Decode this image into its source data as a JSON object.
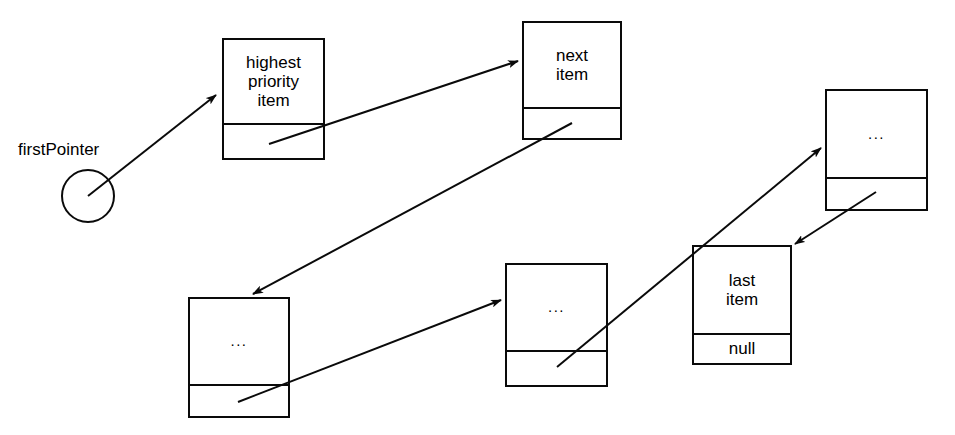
{
  "diagram": {
    "type": "linked-list",
    "background_color": "#ffffff",
    "stroke_color": "#0a0a0a",
    "text_color": "#000000",
    "canvas": {
      "width": 955,
      "height": 435
    }
  },
  "pointer": {
    "label": "firstPointer",
    "circle": {
      "cx": 88,
      "cy": 196,
      "r": 26
    }
  },
  "nodes": [
    {
      "id": "node-highest-priority-item",
      "data_label": "highest\npriority\nitem",
      "pointer_label": "",
      "box": {
        "x": 222,
        "y": 38,
        "w": 103,
        "h": 122,
        "divider_y": 123
      }
    },
    {
      "id": "node-next-item",
      "data_label": "next\nitem",
      "pointer_label": "",
      "box": {
        "x": 522,
        "y": 21,
        "w": 100,
        "h": 119,
        "divider_y": 107
      }
    },
    {
      "id": "node-ellipsis-right",
      "data_label": "...",
      "pointer_label": "",
      "box": {
        "x": 825,
        "y": 89,
        "w": 103,
        "h": 122,
        "divider_y": 177
      }
    },
    {
      "id": "node-ellipsis-bottom-left",
      "data_label": "...",
      "pointer_label": "",
      "box": {
        "x": 188,
        "y": 297,
        "w": 102,
        "h": 121,
        "divider_y": 384
      }
    },
    {
      "id": "node-ellipsis-bottom-middle",
      "data_label": "...",
      "pointer_label": "",
      "box": {
        "x": 505,
        "y": 263,
        "w": 103,
        "h": 124,
        "divider_y": 350
      }
    },
    {
      "id": "node-last-item",
      "data_label": "last\nitem",
      "pointer_label": "null",
      "box": {
        "x": 692,
        "y": 245,
        "w": 100,
        "h": 120,
        "divider_y": 333
      }
    }
  ],
  "arrows": [
    {
      "id": "arrow-firstpointer-to-highest",
      "from": "firstPointer circle",
      "to": "node-highest-priority-item",
      "x1": 88,
      "y1": 196,
      "x2": 216,
      "y2": 95
    },
    {
      "id": "arrow-highest-to-next",
      "from": "node-highest-priority-item",
      "to": "node-next-item",
      "x1": 269,
      "y1": 144,
      "x2": 518,
      "y2": 61
    },
    {
      "id": "arrow-next-to-ellipsis-bottom-left",
      "from": "node-next-item",
      "to": "node-ellipsis-bottom-left",
      "x1": 572,
      "y1": 123,
      "x2": 253,
      "y2": 294
    },
    {
      "id": "arrow-ellipsis-bottom-left-to-ellipsis-bottom-middle",
      "from": "node-ellipsis-bottom-left",
      "to": "node-ellipsis-bottom-middle",
      "x1": 238,
      "y1": 402,
      "x2": 501,
      "y2": 300
    },
    {
      "id": "arrow-ellipsis-bottom-middle-to-ellipsis-right",
      "from": "node-ellipsis-bottom-middle",
      "to": "node-ellipsis-right",
      "x1": 557,
      "y1": 367,
      "x2": 821,
      "y2": 148
    },
    {
      "id": "arrow-ellipsis-right-to-last-item",
      "from": "node-ellipsis-right",
      "to": "node-last-item",
      "x1": 876,
      "y1": 192,
      "x2": 795,
      "y2": 244
    }
  ]
}
